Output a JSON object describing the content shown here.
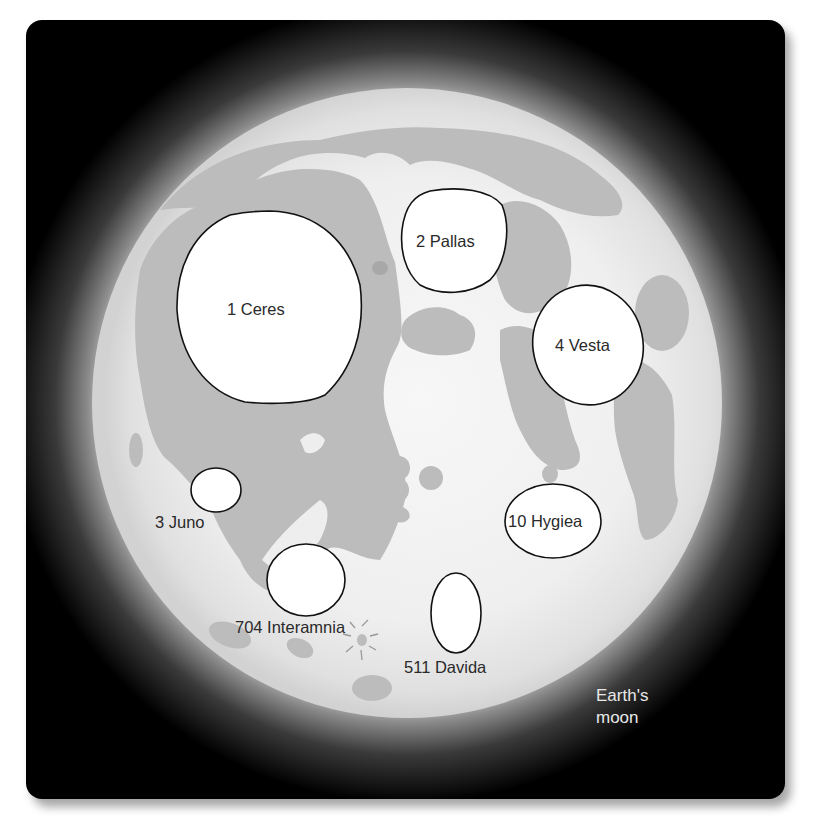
{
  "figure": {
    "caption_line1": "Earth's",
    "caption_line2": "moon",
    "colors": {
      "background": "#000000",
      "moon_highland_center": "#f6f6f6",
      "moon_highland_edge": "#d6d6d6",
      "maria": "#bcbcbc",
      "asteroid_fill": "#ffffff",
      "asteroid_outline": "#111111",
      "label_text": "#2a2a2a",
      "caption_text": "#e8e8e8"
    }
  },
  "asteroids": [
    {
      "id": 1,
      "label": "1 Ceres"
    },
    {
      "id": 2,
      "label": "2 Pallas"
    },
    {
      "id": 3,
      "label": "3 Juno"
    },
    {
      "id": 4,
      "label": "4 Vesta"
    },
    {
      "id": 10,
      "label": "10 Hygiea"
    },
    {
      "id": 511,
      "label": "511 Davida"
    },
    {
      "id": 704,
      "label": "704 Interamnia"
    }
  ]
}
